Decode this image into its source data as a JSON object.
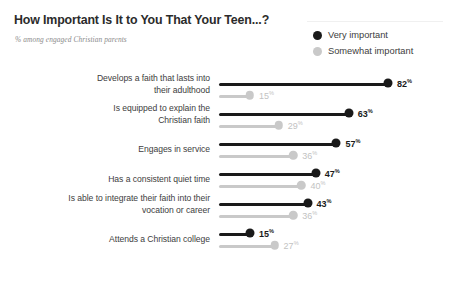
{
  "header": {
    "title": "How Important Is It to You That Your Teen...?",
    "subtitle": "% among engaged Christian parents"
  },
  "legend": {
    "items": [
      {
        "label": "Very important",
        "color": "#1a1a1a",
        "key": "very"
      },
      {
        "label": "Somewhat important",
        "color": "#c9c9c9",
        "key": "somewhat"
      }
    ]
  },
  "chart_data": {
    "type": "bar",
    "subtype": "lollipop",
    "title": "How Important Is It to You That Your Teen...?",
    "subtitle": "% among engaged Christian parents",
    "xlabel": "",
    "ylabel": "",
    "xlim": [
      0,
      100
    ],
    "grid": false,
    "legend_position": "top-right",
    "orientation": "horizontal",
    "value_suffix": "%",
    "categories": [
      "Develops a faith that lasts into their adulthood",
      "Is equipped to explain the Christian faith",
      "Engages in service",
      "Has a consistent quiet time",
      "Is able to integrate their faith into their vocation or career",
      "Attends a Christian college"
    ],
    "category_lines": [
      [
        "Develops a faith that lasts into",
        "their adulthood"
      ],
      [
        "Is equipped to explain the",
        "Christian faith"
      ],
      [
        "Engages in service"
      ],
      [
        "Has a consistent quiet time"
      ],
      [
        "Is able to integrate their faith into their",
        "vocation or career"
      ],
      [
        "Attends a Christian college"
      ]
    ],
    "series": [
      {
        "name": "Very important",
        "color": "#1a1a1a",
        "values": [
          82,
          63,
          57,
          47,
          43,
          15
        ],
        "labels": [
          "82",
          "63",
          "57",
          "47",
          "43",
          "15"
        ]
      },
      {
        "name": "Somewhat important",
        "color": "#c9c9c9",
        "values": [
          15,
          29,
          36,
          40,
          36,
          27
        ],
        "labels": [
          "15",
          "29",
          "36",
          "40",
          "36",
          "27"
        ]
      }
    ]
  }
}
